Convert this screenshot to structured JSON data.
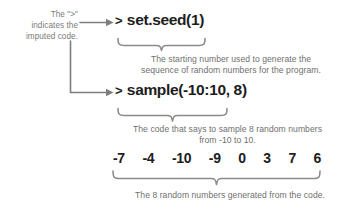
{
  "diagram": {
    "background_color": "#ffffff",
    "code_color": "#1d1d1d",
    "annotation_color": "#7a7a7a"
  },
  "left_note": {
    "line1": "The \">\"",
    "line2": "indicates the",
    "line3": "imputed code."
  },
  "code": {
    "seed": {
      "prompt": ">",
      "text": "set.seed(1)"
    },
    "sample": {
      "prompt": ">",
      "text": "sample(-10:10, 8)"
    }
  },
  "captions": {
    "seed_line1": "The starting number used to generate the",
    "seed_line2": "sequence of random numbers for the program.",
    "sample_line1": "The code that says to sample 8 random numbers",
    "sample_line2": "from -10 to 10.",
    "output_line1": "The 8 random numbers generated from the code."
  },
  "output_numbers": [
    "-7",
    "-4",
    "-10",
    "-9",
    "0",
    "3",
    "7",
    "6"
  ],
  "icons": {
    "arrow_to_seed": "arrow-right-icon",
    "arrow_to_sample": "arrow-right-icon",
    "elbow_connector": "elbow-connector-icon",
    "brace_seed": "curly-brace-icon",
    "brace_sample": "curly-brace-icon",
    "brace_output": "curly-brace-icon"
  }
}
